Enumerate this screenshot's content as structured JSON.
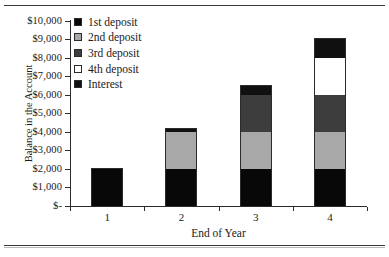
{
  "chart_data": {
    "type": "bar",
    "subtype": "stacked-bar",
    "title": "",
    "xlabel": "End of Year",
    "ylabel": "Balance in the Account",
    "categories": [
      "1",
      "2",
      "3",
      "4"
    ],
    "ylim": [
      0,
      10000
    ],
    "ytick_values": [
      0,
      1000,
      2000,
      3000,
      4000,
      5000,
      6000,
      7000,
      8000,
      9000,
      10000
    ],
    "ytick_labels": [
      "$-",
      "$1,000",
      "$2,000",
      "$3,000",
      "$4,000",
      "$5,000",
      "$6,000",
      "$7,000",
      "$8,000",
      "$9,000",
      "$10,000"
    ],
    "grid": false,
    "legend_position": "upper-left-inside",
    "series": [
      {
        "name": "1st deposit",
        "color": "#080808",
        "values": [
          2000,
          2000,
          2000,
          2000
        ]
      },
      {
        "name": "2nd deposit",
        "color": "#a8a8a8",
        "values": [
          0,
          2000,
          2000,
          2000
        ]
      },
      {
        "name": "3rd deposit",
        "color": "#3d3d3d",
        "values": [
          0,
          0,
          2000,
          2000
        ]
      },
      {
        "name": "4th deposit",
        "color": "#ffffff",
        "values": [
          0,
          0,
          0,
          2000
        ]
      },
      {
        "name": "Interest",
        "color": "#101010",
        "values": [
          60,
          220,
          540,
          1060
        ]
      }
    ],
    "totals": [
      2060,
      4220,
      6540,
      9060
    ]
  },
  "axes": {
    "y_title": "Balance in the Account",
    "x_title": "End of Year",
    "y_labels": [
      "$10,000",
      "$9,000",
      "$8,000",
      "$7,000",
      "$6,000",
      "$5,000",
      "$4,000",
      "$3,000",
      "$2,000",
      "$1,000",
      "$-"
    ],
    "x_labels": [
      "1",
      "2",
      "3",
      "4"
    ]
  },
  "legend": {
    "items": [
      {
        "label": "1st deposit",
        "color": "#080808"
      },
      {
        "label": "2nd deposit",
        "color": "#a8a8a8"
      },
      {
        "label": "3rd deposit",
        "color": "#3d3d3d"
      },
      {
        "label": "4th deposit",
        "color": "#ffffff"
      },
      {
        "label": "Interest",
        "color": "#101010"
      }
    ]
  },
  "colors": {
    "axis": "#2b2b2b",
    "text": "#1a1a1a",
    "rule": "#3a3a3a",
    "background": "#ffffff"
  }
}
